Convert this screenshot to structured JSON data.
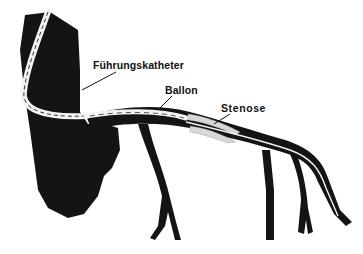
{
  "figure": {
    "labels": {
      "guide_catheter": "Führungskatheter",
      "balloon": "Ballon",
      "stenosis": "Stenose"
    },
    "colors": {
      "vessel": "#141414",
      "catheter": "#f2f2f2",
      "background": "#ffffff",
      "text": "#111111"
    }
  }
}
